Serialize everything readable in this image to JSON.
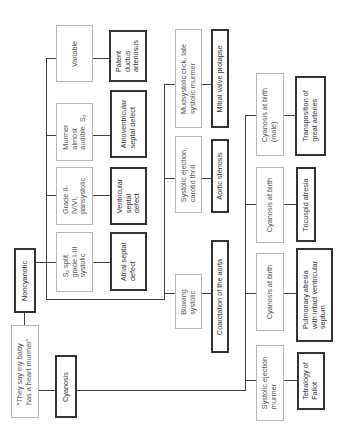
{
  "root": {
    "label": "“They say my baby\nhas a heart murmer”"
  },
  "categories": {
    "noncyanotic": "Noncyanotic",
    "cyanosis": "Cyanosis"
  },
  "noncyanotic_findings": [
    {
      "finding": "S₂ split,\ngrade I-III\nsystolic",
      "diagnosis": "Atrial septal\ndefect"
    },
    {
      "finding": "Grade II-\nIV/VI,\npansystolic",
      "diagnosis": "Ventricular\nseptal\ndefect"
    },
    {
      "finding": "Murmer\nalmost\naudible, S₂",
      "diagnosis": "Atrioventricular\nseptal defect"
    },
    {
      "finding": "Variable",
      "diagnosis": "Patent\nductus\narteriosus"
    },
    {
      "finding": "Blowing\nsystolic",
      "diagnosis": "Coarctation of the aorta"
    },
    {
      "finding": "Systolic ejection,\ncarotid thrill",
      "diagnosis": "Aortic stenosis"
    },
    {
      "finding": "Mudsystolic click, late\nsystolic murmer",
      "diagnosis": "Mitral valve prolapse"
    }
  ],
  "cyanotic_findings": [
    {
      "finding": "Systolic ejection\nmurmer",
      "diagnosis": "Tetralogy of\nFallot"
    },
    {
      "finding": "Cyanosis at birth",
      "diagnosis": "Pulmonary atresia\nwith intact ventricular\nseptum"
    },
    {
      "finding": "Cyanosis at birth",
      "diagnosis": "Tricuspid atresia"
    },
    {
      "finding": "Cyanosis at birth\n(male)",
      "diagnosis": "Transposition of\ngreat arteries"
    }
  ]
}
